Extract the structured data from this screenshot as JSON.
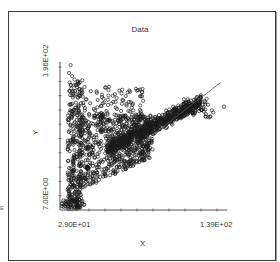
{
  "chart_data": {
    "type": "scatter",
    "title": "Data",
    "xlabel": "X",
    "ylabel": "Y",
    "x_tick_labels": [
      "2.90E+01",
      "1.39E+02"
    ],
    "y_tick_labels": [
      "7.00E+00",
      "1.96E+02"
    ],
    "xlim": [
      29,
      139
    ],
    "ylim": [
      7,
      196
    ],
    "grid": false,
    "legend": null,
    "marker": "open-circle",
    "regression_line": {
      "x": [
        33,
        135
      ],
      "y": [
        18,
        170
      ]
    },
    "outliers": [
      {
        "x": 137,
        "y": 139
      },
      {
        "x": 36,
        "y": 192
      },
      {
        "x": 35,
        "y": 182
      },
      {
        "x": 37,
        "y": 178
      }
    ],
    "clusters": [
      {
        "name": "low-dense",
        "x": [
          30,
          45
        ],
        "y": [
          8,
          20
        ],
        "count": 70
      },
      {
        "name": "vertical-spike",
        "x": [
          34,
          43
        ],
        "y": [
          20,
          175
        ],
        "count": 260
      },
      {
        "name": "main-body",
        "x": [
          42,
          90
        ],
        "y": [
          50,
          130
        ],
        "count": 700
      },
      {
        "name": "diagonal-band",
        "x": [
          60,
          122
        ],
        "y": [
          85,
          145
        ],
        "count": 650
      },
      {
        "name": "upper-scatter",
        "x": [
          40,
          85
        ],
        "y": [
          120,
          165
        ],
        "count": 110
      },
      {
        "name": "right-tail",
        "x": [
          110,
          130
        ],
        "y": [
          125,
          150
        ],
        "count": 40
      }
    ],
    "plot_area_px": {
      "left": 60,
      "top": 62,
      "right": 227,
      "bottom": 210
    },
    "x_tick_count": 10,
    "y_tick_count": 10
  },
  "chart": {
    "title": "Data",
    "x_label": "X",
    "y_label": "Y",
    "x_min_label": "2.90E+01",
    "x_max_label": "1.39E+02",
    "y_min_label": "7.00E+00",
    "y_max_label": "1.96E+02",
    "side_mark": "E"
  },
  "colors": {
    "background": "#ffffff",
    "frame": "#3a3a3a",
    "axis": "#555555",
    "marker": "#1a1a1a",
    "regression_line": "#555555"
  }
}
